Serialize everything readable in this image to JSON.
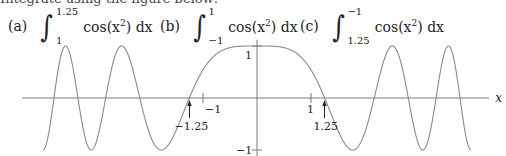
{
  "header_cutoff_text": "Integrate using the figure below:",
  "problems": [
    {
      "label": "(a)",
      "lower": "1",
      "upper": "1.25",
      "integrand": "cos(x",
      "power": "2",
      "tail": ") dx"
    },
    {
      "label": "(b)",
      "lower": "−1",
      "upper": "1",
      "integrand": "cos(x",
      "power": "2",
      "tail": ") dx"
    },
    {
      "label": "(c)",
      "lower": "1.25",
      "upper": "−1",
      "integrand": "cos(x",
      "power": "2",
      "tail": ") dx"
    }
  ],
  "chart_data": {
    "type": "line",
    "title": "",
    "function": "cos(x^2)",
    "series": [
      {
        "name": "y = cos(x^2)",
        "x_range": [
          -3.96,
          3.96
        ]
      }
    ],
    "xlabel": "x",
    "ylabel": "",
    "xlim": [
      -4.35,
      4.3
    ],
    "ylim": [
      -1.1,
      1.1
    ],
    "x_ticks": [
      {
        "value": -1,
        "label": "−1"
      },
      {
        "value": 1,
        "label": "1"
      }
    ],
    "y_ticks": [
      {
        "value": 1,
        "label": "1"
      },
      {
        "value": -1,
        "label": "−1"
      }
    ],
    "annotations": [
      {
        "type": "arrow",
        "x": -1.25,
        "label": "−1.25"
      },
      {
        "type": "arrow",
        "x": 1.25,
        "label": "1.25"
      }
    ],
    "grid": false,
    "line_color": "#8a8a8a",
    "axis_color": "#7a7a7a"
  }
}
